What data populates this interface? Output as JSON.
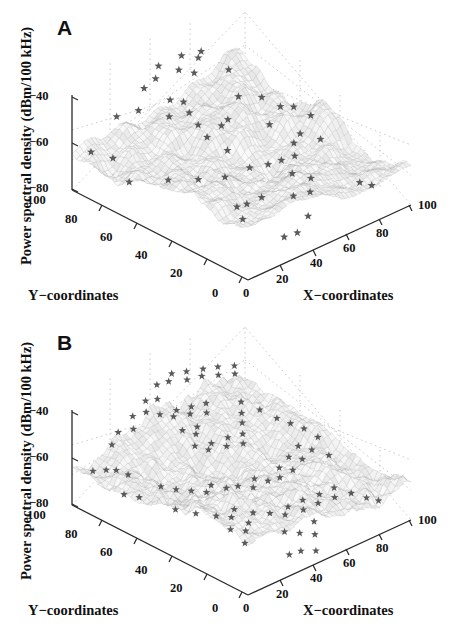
{
  "figure": {
    "panels": [
      {
        "id": "A",
        "label": "A",
        "zaxis_title": "Power spectral density (dBm/100 kHz)",
        "xaxis_title": "X−coordinates",
        "yaxis_title": "Y−coordinates",
        "z_ticks": [
          "−40",
          "−60",
          "−80"
        ],
        "y_ticks": [
          "100",
          "80",
          "60",
          "40",
          "20",
          "0"
        ],
        "x_ticks": [
          "0",
          "20",
          "40",
          "60",
          "80",
          "100"
        ]
      },
      {
        "id": "B",
        "label": "B",
        "zaxis_title": "Power spectral density (dBm/100 kHz)",
        "xaxis_title": "X−coordinates",
        "yaxis_title": "Y−coordinates",
        "z_ticks": [
          "−40",
          "−60",
          "−80"
        ],
        "y_ticks": [
          "100",
          "80",
          "60",
          "40",
          "20",
          "0"
        ],
        "x_ticks": [
          "0",
          "20",
          "40",
          "60",
          "80",
          "100"
        ]
      }
    ]
  },
  "colors": {
    "background": "#ffffff",
    "text": "#111111",
    "axis_line": "#2b2b2b",
    "grid_dotted": "#c9c9c9",
    "surface_mesh": "#b9b9b9",
    "surface_fill": "#ededed",
    "marker": "#5a5a5a"
  },
  "chart_data": [
    {
      "type": "surface",
      "panel": "A",
      "title": "A",
      "xlabel": "X−coordinates",
      "ylabel": "Y−coordinates",
      "zlabel": "Power spectral density (dBm/100 kHz)",
      "xlim": [
        0,
        100
      ],
      "ylim": [
        0,
        100
      ],
      "zlim": [
        -90,
        -30
      ],
      "xticks": [
        0,
        20,
        40,
        60,
        80,
        100
      ],
      "yticks": [
        0,
        20,
        40,
        60,
        80,
        100
      ],
      "zticks": [
        -80,
        -60,
        -40
      ],
      "grid": true,
      "legend": "none",
      "marker_symbol": "star",
      "marker_count": 52,
      "markers": [
        {
          "x": 3,
          "y": 92,
          "z": -62
        },
        {
          "x": 10,
          "y": 86,
          "z": -66
        },
        {
          "x": 7,
          "y": 74,
          "z": -73
        },
        {
          "x": 22,
          "y": 95,
          "z": -50
        },
        {
          "x": 30,
          "y": 90,
          "z": -47
        },
        {
          "x": 41,
          "y": 97,
          "z": -42
        },
        {
          "x": 47,
          "y": 96,
          "z": -38
        },
        {
          "x": 52,
          "y": 99,
          "z": -34
        },
        {
          "x": 58,
          "y": 93,
          "z": -36
        },
        {
          "x": 65,
          "y": 98,
          "z": -33
        },
        {
          "x": 71,
          "y": 94,
          "z": -35
        },
        {
          "x": 76,
          "y": 97,
          "z": -35
        },
        {
          "x": 62,
          "y": 88,
          "z": -37
        },
        {
          "x": 44,
          "y": 85,
          "z": -44
        },
        {
          "x": 49,
          "y": 82,
          "z": -46
        },
        {
          "x": 46,
          "y": 76,
          "z": -48
        },
        {
          "x": 45,
          "y": 70,
          "z": -52
        },
        {
          "x": 44,
          "y": 64,
          "z": -56
        },
        {
          "x": 55,
          "y": 66,
          "z": -55
        },
        {
          "x": 60,
          "y": 67,
          "z": -54
        },
        {
          "x": 81,
          "y": 86,
          "z": -43
        },
        {
          "x": 74,
          "y": 74,
          "z": -50
        },
        {
          "x": 84,
          "y": 70,
          "z": -53
        },
        {
          "x": 89,
          "y": 64,
          "z": -58
        },
        {
          "x": 95,
          "y": 62,
          "z": -60
        },
        {
          "x": 99,
          "y": 56,
          "z": -64
        },
        {
          "x": 18,
          "y": 62,
          "z": -70
        },
        {
          "x": 30,
          "y": 56,
          "z": -72
        },
        {
          "x": 42,
          "y": 52,
          "z": -74
        },
        {
          "x": 55,
          "y": 50,
          "z": -73
        },
        {
          "x": 62,
          "y": 46,
          "z": -72
        },
        {
          "x": 68,
          "y": 44,
          "z": -71
        },
        {
          "x": 74,
          "y": 42,
          "z": -70
        },
        {
          "x": 80,
          "y": 48,
          "z": -68
        },
        {
          "x": 86,
          "y": 50,
          "z": -66
        },
        {
          "x": 92,
          "y": 44,
          "z": -69
        },
        {
          "x": 66,
          "y": 36,
          "z": -74
        },
        {
          "x": 71,
          "y": 30,
          "z": -76
        },
        {
          "x": 31,
          "y": 35,
          "z": -78
        },
        {
          "x": 36,
          "y": 34,
          "z": -78
        },
        {
          "x": 44,
          "y": 33,
          "z": -77
        },
        {
          "x": 27,
          "y": 28,
          "z": -80
        },
        {
          "x": 57,
          "y": 27,
          "z": -79
        },
        {
          "x": 64,
          "y": 24,
          "z": -78
        },
        {
          "x": 52,
          "y": 14,
          "z": -82
        },
        {
          "x": 33,
          "y": 10,
          "z": -84
        },
        {
          "x": 40,
          "y": 9,
          "z": -84
        },
        {
          "x": 88,
          "y": 18,
          "z": -80
        },
        {
          "x": 91,
          "y": 14,
          "z": -81
        },
        {
          "x": 78,
          "y": 60,
          "z": -62
        },
        {
          "x": 50,
          "y": 58,
          "z": -64
        },
        {
          "x": 38,
          "y": 80,
          "z": -49
        }
      ]
    },
    {
      "type": "surface",
      "panel": "B",
      "title": "B",
      "xlabel": "X−coordinates",
      "ylabel": "Y−coordinates",
      "zlabel": "Power spectral density (dBm/100 kHz)",
      "xlim": [
        0,
        100
      ],
      "ylim": [
        0,
        100
      ],
      "zlim": [
        -90,
        -30
      ],
      "xticks": [
        0,
        20,
        40,
        60,
        80,
        100
      ],
      "yticks": [
        0,
        20,
        40,
        60,
        80,
        100
      ],
      "zticks": [
        -80,
        -60,
        -40
      ],
      "grid": true,
      "legend": "none",
      "marker_symbol": "star",
      "marker_count": 96,
      "markers": [
        {
          "x": 2,
          "y": 90,
          "z": -63
        },
        {
          "x": 8,
          "y": 88,
          "z": -64
        },
        {
          "x": 12,
          "y": 86,
          "z": -65
        },
        {
          "x": 15,
          "y": 82,
          "z": -67
        },
        {
          "x": 6,
          "y": 76,
          "z": -72
        },
        {
          "x": 11,
          "y": 72,
          "z": -74
        },
        {
          "x": 18,
          "y": 94,
          "z": -56
        },
        {
          "x": 24,
          "y": 96,
          "z": -52
        },
        {
          "x": 29,
          "y": 92,
          "z": -50
        },
        {
          "x": 34,
          "y": 97,
          "z": -47
        },
        {
          "x": 39,
          "y": 94,
          "z": -45
        },
        {
          "x": 43,
          "y": 98,
          "z": -42
        },
        {
          "x": 47,
          "y": 95,
          "z": -41
        },
        {
          "x": 51,
          "y": 99,
          "z": -36
        },
        {
          "x": 55,
          "y": 96,
          "z": -34
        },
        {
          "x": 59,
          "y": 98,
          "z": -32
        },
        {
          "x": 63,
          "y": 93,
          "z": -35
        },
        {
          "x": 67,
          "y": 97,
          "z": -34
        },
        {
          "x": 71,
          "y": 92,
          "z": -36
        },
        {
          "x": 75,
          "y": 95,
          "z": -35
        },
        {
          "x": 79,
          "y": 90,
          "z": -38
        },
        {
          "x": 83,
          "y": 94,
          "z": -37
        },
        {
          "x": 87,
          "y": 88,
          "z": -40
        },
        {
          "x": 91,
          "y": 92,
          "z": -39
        },
        {
          "x": 41,
          "y": 88,
          "z": -44
        },
        {
          "x": 45,
          "y": 84,
          "z": -45
        },
        {
          "x": 49,
          "y": 86,
          "z": -44
        },
        {
          "x": 53,
          "y": 82,
          "z": -46
        },
        {
          "x": 57,
          "y": 85,
          "z": -45
        },
        {
          "x": 61,
          "y": 80,
          "z": -48
        },
        {
          "x": 65,
          "y": 84,
          "z": -46
        },
        {
          "x": 44,
          "y": 78,
          "z": -50
        },
        {
          "x": 48,
          "y": 74,
          "z": -52
        },
        {
          "x": 52,
          "y": 77,
          "z": -51
        },
        {
          "x": 43,
          "y": 70,
          "z": -55
        },
        {
          "x": 47,
          "y": 66,
          "z": -57
        },
        {
          "x": 51,
          "y": 68,
          "z": -56
        },
        {
          "x": 56,
          "y": 64,
          "z": -58
        },
        {
          "x": 60,
          "y": 67,
          "z": -56
        },
        {
          "x": 64,
          "y": 62,
          "z": -59
        },
        {
          "x": 68,
          "y": 66,
          "z": -57
        },
        {
          "x": 72,
          "y": 70,
          "z": -54
        },
        {
          "x": 76,
          "y": 74,
          "z": -52
        },
        {
          "x": 80,
          "y": 78,
          "z": -49
        },
        {
          "x": 85,
          "y": 72,
          "z": -53
        },
        {
          "x": 89,
          "y": 66,
          "z": -57
        },
        {
          "x": 93,
          "y": 62,
          "z": -60
        },
        {
          "x": 97,
          "y": 58,
          "z": -63
        },
        {
          "x": 99,
          "y": 52,
          "z": -66
        },
        {
          "x": 20,
          "y": 68,
          "z": -69
        },
        {
          "x": 25,
          "y": 64,
          "z": -71
        },
        {
          "x": 30,
          "y": 60,
          "z": -72
        },
        {
          "x": 35,
          "y": 56,
          "z": -73
        },
        {
          "x": 40,
          "y": 58,
          "z": -72
        },
        {
          "x": 45,
          "y": 54,
          "z": -74
        },
        {
          "x": 50,
          "y": 52,
          "z": -74
        },
        {
          "x": 55,
          "y": 48,
          "z": -75
        },
        {
          "x": 59,
          "y": 51,
          "z": -73
        },
        {
          "x": 63,
          "y": 47,
          "z": -74
        },
        {
          "x": 67,
          "y": 44,
          "z": -72
        },
        {
          "x": 71,
          "y": 48,
          "z": -70
        },
        {
          "x": 75,
          "y": 44,
          "z": -71
        },
        {
          "x": 79,
          "y": 50,
          "z": -68
        },
        {
          "x": 83,
          "y": 46,
          "z": -69
        },
        {
          "x": 87,
          "y": 52,
          "z": -66
        },
        {
          "x": 91,
          "y": 48,
          "z": -68
        },
        {
          "x": 95,
          "y": 42,
          "z": -70
        },
        {
          "x": 16,
          "y": 56,
          "z": -75
        },
        {
          "x": 22,
          "y": 50,
          "z": -77
        },
        {
          "x": 28,
          "y": 44,
          "z": -78
        },
        {
          "x": 33,
          "y": 40,
          "z": -79
        },
        {
          "x": 38,
          "y": 43,
          "z": -78
        },
        {
          "x": 26,
          "y": 34,
          "z": -80
        },
        {
          "x": 31,
          "y": 30,
          "z": -81
        },
        {
          "x": 36,
          "y": 33,
          "z": -80
        },
        {
          "x": 42,
          "y": 36,
          "z": -78
        },
        {
          "x": 48,
          "y": 32,
          "z": -79
        },
        {
          "x": 53,
          "y": 28,
          "z": -80
        },
        {
          "x": 58,
          "y": 31,
          "z": -79
        },
        {
          "x": 62,
          "y": 26,
          "z": -80
        },
        {
          "x": 66,
          "y": 30,
          "z": -78
        },
        {
          "x": 70,
          "y": 25,
          "z": -79
        },
        {
          "x": 74,
          "y": 28,
          "z": -77
        },
        {
          "x": 78,
          "y": 23,
          "z": -78
        },
        {
          "x": 82,
          "y": 27,
          "z": -76
        },
        {
          "x": 86,
          "y": 21,
          "z": -78
        },
        {
          "x": 90,
          "y": 16,
          "z": -80
        },
        {
          "x": 93,
          "y": 12,
          "z": -81
        },
        {
          "x": 44,
          "y": 20,
          "z": -82
        },
        {
          "x": 49,
          "y": 16,
          "z": -83
        },
        {
          "x": 54,
          "y": 12,
          "z": -84
        },
        {
          "x": 34,
          "y": 8,
          "z": -85
        },
        {
          "x": 40,
          "y": 7,
          "z": -85
        },
        {
          "x": 46,
          "y": 4,
          "z": -86
        },
        {
          "x": 60,
          "y": 18,
          "z": -82
        },
        {
          "x": 24,
          "y": 24,
          "z": -82
        }
      ]
    }
  ]
}
